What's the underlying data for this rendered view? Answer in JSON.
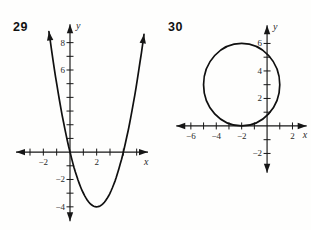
{
  "page": {
    "background": "#ffffff",
    "ink": "#161616"
  },
  "chart_data": [
    {
      "type": "line",
      "label": "29",
      "title": "",
      "xlabel": "x",
      "ylabel": "y",
      "xlim": [
        -4.5,
        6.0
      ],
      "ylim": [
        -5.4,
        9.8
      ],
      "axis_x_span": [
        -4.05,
        5.85
      ],
      "axis_y_span": [
        -5.05,
        9.35
      ],
      "x_ticks": [
        -3,
        -2,
        -1,
        1,
        2,
        3,
        4,
        5
      ],
      "x_tick_labels": [
        -2,
        2
      ],
      "y_ticks": [
        -4,
        -3,
        -2,
        -1,
        1,
        2,
        3,
        4,
        5,
        6,
        7,
        8
      ],
      "y_tick_labels": [
        -4,
        -2,
        6,
        8
      ],
      "grid": false,
      "legend": null,
      "series": [
        {
          "name": "upward-parabola",
          "kind": "parabola",
          "vertex": [
            2,
            -4
          ],
          "leading_coefficient": 1,
          "x_intercepts": [
            0,
            4
          ],
          "y_intercept": 0,
          "x_range": [
            -1.58,
            5.55
          ],
          "end_arrows": true
        }
      ]
    },
    {
      "type": "line",
      "label": "30",
      "title": "",
      "xlabel": "x",
      "ylabel": "y",
      "xlim": [
        -8.43,
        3.38
      ],
      "ylim": [
        -4.15,
        7.85
      ],
      "axis_x_span": [
        -7.15,
        3.12
      ],
      "axis_y_span": [
        -3.4,
        7.33
      ],
      "x_ticks": [
        -6,
        -5,
        -4,
        -3,
        -2,
        -1,
        1,
        2
      ],
      "x_tick_labels": [
        -6,
        -4,
        -2,
        2
      ],
      "y_ticks": [
        -2,
        -1,
        1,
        2,
        3,
        4,
        5,
        6
      ],
      "y_tick_labels": [
        -2,
        2,
        4,
        6
      ],
      "grid": false,
      "legend": null,
      "series": [
        {
          "name": "circle",
          "kind": "circle",
          "center": [
            -2,
            3
          ],
          "radius": 3,
          "tangent_to_x_axis_at": [
            -2,
            0
          ]
        }
      ]
    }
  ]
}
